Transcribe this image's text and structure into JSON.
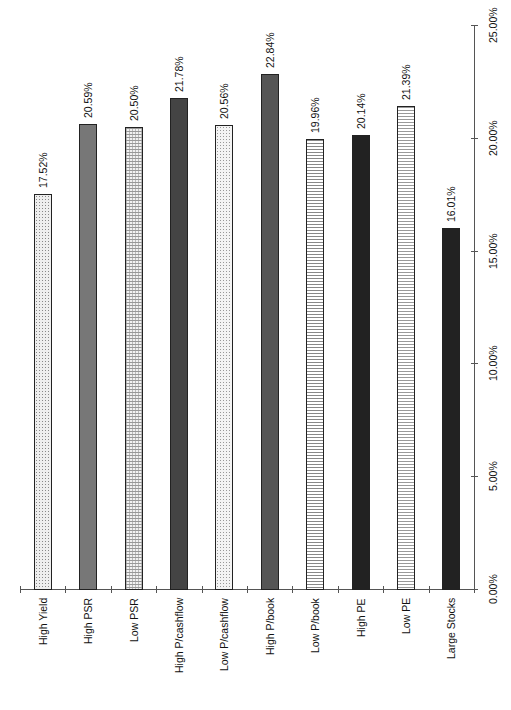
{
  "chart_data": {
    "type": "bar",
    "orientation": "rotated-90",
    "title": "",
    "xlabel": "",
    "ylabel": "",
    "categories": [
      "High Yield",
      "High PSR",
      "Low PSR",
      "High P/cashflow",
      "Low P/cashflow",
      "High P/book",
      "Low P/book",
      "High PE",
      "Low PE",
      "Large Stocks"
    ],
    "values": [
      17.52,
      20.59,
      20.5,
      21.78,
      20.56,
      22.84,
      19.96,
      20.14,
      21.39,
      16.01
    ],
    "value_labels": [
      "17.52%",
      "20.59%",
      "20.50%",
      "21.78%",
      "20.56%",
      "22.84%",
      "19.96%",
      "20.14%",
      "21.39%",
      "16.01%"
    ],
    "patterns": [
      "pat-dots-light",
      "pat-medium",
      "pat-grid-fine",
      "pat-dark",
      "pat-dots-fine",
      "pat-darkmed",
      "pat-hlines",
      "pat-darkest",
      "pat-hlines-dotted",
      "pat-darkest"
    ],
    "ylim": [
      0,
      25
    ],
    "value_ticks": [
      0,
      5,
      10,
      15,
      20,
      25
    ],
    "value_tick_labels": [
      "0.00%",
      "5.00%",
      "10.00%",
      "15.00%",
      "20.00%",
      "25.00%"
    ],
    "grid": false,
    "legend": null
  }
}
